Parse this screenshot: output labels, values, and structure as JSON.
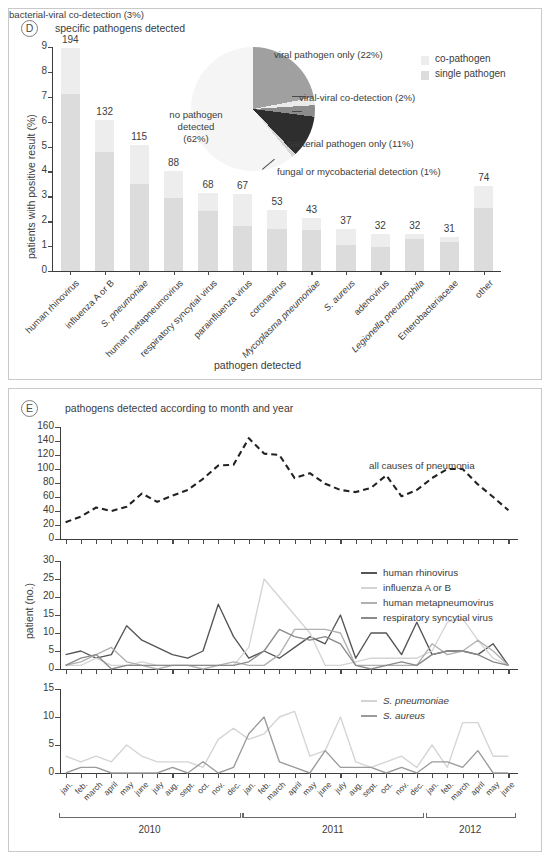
{
  "figure": {
    "width": 550,
    "height": 860
  },
  "panel_d": {
    "badge": "D",
    "caption": "specific pathogens detected",
    "legend": [
      {
        "label": "co-pathogen",
        "color": "#ededed",
        "name": "co-pathogen"
      },
      {
        "label": "single pathogen",
        "color": "#dcdcdc",
        "name": "single-pathogen"
      }
    ],
    "pie": {
      "center_label_lines": [
        "no pathogen",
        "detected",
        "(62%)"
      ],
      "slices": [
        {
          "label": "no pathogen detected (62%)",
          "value": 62,
          "color": "#f5f5f5"
        },
        {
          "label": "viral pathogen only (22%)",
          "value": 22,
          "color": "#a0a0a0"
        },
        {
          "label": "viral-viral co-detection (2%)",
          "value": 2,
          "color": "#ebebeb"
        },
        {
          "label": "bacterial-viral co-detection (3%)",
          "value": 3,
          "color": "#8c8c8c"
        },
        {
          "label": "bacterial pathogen only (11%)",
          "value": 11,
          "color": "#2e2e2e"
        },
        {
          "label": "fungal or mycobacterial detection (1%)",
          "value": 1,
          "color": "#d6d6d6"
        }
      ],
      "callouts": [
        "viral pathogen only (22%)",
        "viral-viral co-detection (2%)",
        "bacterial-viral co-detection (3%)",
        "bacterial pathogen only (11%)",
        "fungal or mycobacterial detection (1%)"
      ]
    },
    "chart_data": {
      "type": "bar",
      "title": "specific pathogens detected",
      "xlabel": "pathogen detected",
      "ylabel": "patients with positive result (%)",
      "ylim": [
        0,
        9
      ],
      "yticks": [
        0,
        1,
        2,
        3,
        4,
        5,
        6,
        7,
        8,
        9
      ],
      "stacked": true,
      "grid": false,
      "legend_position": "top-right",
      "categories": [
        "human rhinovirus",
        "influenza A or B",
        "S. pneumoniae",
        "human metapneumovirus",
        "respiratory syncytial virus",
        "parainfluenza virus",
        "coronavirus",
        "Mycoplasma pneumoniae",
        "S. aureus",
        "adenovirus",
        "Legionella pneumophila",
        "Enterobacteriaceae",
        "other"
      ],
      "categories_italic": [
        false,
        false,
        true,
        false,
        false,
        false,
        false,
        true,
        true,
        false,
        true,
        false,
        false
      ],
      "counts": [
        194,
        132,
        115,
        88,
        68,
        67,
        53,
        43,
        37,
        32,
        32,
        31,
        74
      ],
      "series": [
        {
          "name": "single pathogen",
          "color": "#dcdcdc",
          "values": [
            7.1,
            4.8,
            3.5,
            2.92,
            2.42,
            1.82,
            1.68,
            1.63,
            1.03,
            0.97,
            1.28,
            1.18,
            2.52
          ]
        },
        {
          "name": "co-pathogen",
          "color": "#ededed",
          "values": [
            1.86,
            1.28,
            1.55,
            1.08,
            0.72,
            1.28,
            0.76,
            0.5,
            0.67,
            0.53,
            0.22,
            0.17,
            0.88
          ]
        }
      ],
      "totals_percent": [
        8.96,
        6.08,
        5.05,
        4.0,
        3.14,
        3.1,
        2.44,
        2.13,
        1.7,
        1.5,
        1.5,
        1.35,
        3.4
      ]
    }
  },
  "panel_e": {
    "badge": "E",
    "caption": "pathogens detected according to month and year",
    "ylabel": "patient (no.)",
    "months": [
      "jan.",
      "feb.",
      "march",
      "april",
      "may",
      "june",
      "july",
      "aug.",
      "sept.",
      "oct.",
      "nov.",
      "dec.",
      "jan.",
      "feb.",
      "march",
      "april",
      "may",
      "june",
      "july",
      "aug.",
      "sept.",
      "oct.",
      "nov.",
      "dec.",
      "jan.",
      "feb.",
      "march",
      "april",
      "may",
      "june"
    ],
    "years": [
      {
        "label": "2010",
        "start_index": 0,
        "end_index": 11
      },
      {
        "label": "2011",
        "start_index": 12,
        "end_index": 23
      },
      {
        "label": "2012",
        "start_index": 24,
        "end_index": 29
      }
    ],
    "chart_data": [
      {
        "type": "line",
        "id": "all-causes",
        "title": "",
        "xlabel": "",
        "ylabel": "patient (no.)",
        "ylim": [
          0,
          160
        ],
        "yticks": [
          0,
          20,
          40,
          60,
          80,
          100,
          120,
          140,
          160
        ],
        "grid": false,
        "legend_position": "inside-right",
        "x": [
          "jan. 2010",
          "feb. 2010",
          "march 2010",
          "april 2010",
          "may 2010",
          "june 2010",
          "july 2010",
          "aug. 2010",
          "sept. 2010",
          "oct. 2010",
          "nov. 2010",
          "dec. 2010",
          "jan. 2011",
          "feb. 2011",
          "march 2011",
          "april 2011",
          "may 2011",
          "june 2011",
          "july 2011",
          "aug. 2011",
          "sept. 2011",
          "oct. 2011",
          "nov. 2011",
          "dec. 2011",
          "jan. 2012",
          "feb. 2012",
          "march 2012",
          "april 2012",
          "may 2012",
          "june 2012"
        ],
        "series": [
          {
            "name": "all causes of pneumonia",
            "color": "#222222",
            "dashed": true,
            "values": [
              24,
              32,
              45,
              40,
              46,
              65,
              53,
              62,
              70,
              86,
              105,
              106,
              144,
              122,
              120,
              87,
              94,
              79,
              70,
              67,
              73,
              91,
              61,
              70,
              87,
              100,
              100,
              78,
              60,
              41
            ]
          }
        ]
      },
      {
        "type": "line",
        "id": "viruses",
        "title": "",
        "xlabel": "",
        "ylabel": "patient (no.)",
        "ylim": [
          0,
          30
        ],
        "yticks": [
          0,
          5,
          10,
          15,
          20,
          25,
          30
        ],
        "grid": false,
        "legend_position": "inside-right",
        "series": [
          {
            "name": "human rhinovirus",
            "color": "#555555",
            "values": [
              4,
              5,
              3,
              4,
              12,
              8,
              6,
              4,
              3,
              5,
              18,
              9,
              3,
              5,
              3,
              6,
              9,
              7,
              15,
              3,
              10,
              10,
              4,
              13,
              4,
              5,
              5,
              4,
              7,
              1
            ]
          },
          {
            "name": "influenza A or B",
            "color": "#d4d4d4",
            "values": [
              1,
              1,
              3,
              1,
              1,
              2,
              1,
              1,
              1,
              1,
              1,
              1,
              6,
              25,
              20,
              15,
              10,
              1,
              1,
              2,
              3,
              3,
              3,
              3,
              5,
              13,
              14,
              8,
              3,
              1
            ]
          },
          {
            "name": "human metapneumovirus",
            "color": "#b0b0b0",
            "values": [
              1,
              2,
              4,
              6,
              2,
              1,
              0,
              1,
              1,
              0,
              1,
              2,
              1,
              1,
              4,
              11,
              11,
              11,
              10,
              1,
              1,
              1,
              1,
              1,
              7,
              4,
              5,
              8,
              5,
              1
            ]
          },
          {
            "name": "respiratory syncytial virus",
            "color": "#8a8a8a",
            "values": [
              1,
              3,
              4,
              0,
              1,
              1,
              1,
              1,
              1,
              1,
              1,
              1,
              2,
              5,
              11,
              9,
              8,
              9,
              7,
              1,
              0,
              1,
              2,
              1,
              4,
              5,
              5,
              4,
              2,
              1
            ]
          }
        ]
      },
      {
        "type": "line",
        "id": "bacteria",
        "title": "",
        "xlabel": "",
        "ylabel": "patient (no.)",
        "ylim": [
          0,
          15
        ],
        "yticks": [
          0,
          5,
          10,
          15
        ],
        "grid": false,
        "legend_position": "inside-right",
        "series": [
          {
            "name": "S. pneumoniae",
            "color": "#d4d4d4",
            "italic": true,
            "values": [
              3,
              2,
              3,
              2,
              5,
              3,
              2,
              2,
              2,
              1,
              6,
              8,
              6,
              7,
              10,
              11,
              3,
              4,
              10,
              2,
              1,
              2,
              3,
              1,
              5,
              1,
              9,
              9,
              3,
              3
            ]
          },
          {
            "name": "S. aureus",
            "color": "#9b9b9b",
            "italic": true,
            "values": [
              0,
              1,
              1,
              0,
              0,
              0,
              0,
              1,
              0,
              2,
              0,
              1,
              7,
              10,
              2,
              1,
              0,
              4,
              1,
              1,
              1,
              0,
              1,
              0,
              2,
              2,
              1,
              4,
              0,
              0
            ]
          }
        ]
      }
    ]
  }
}
